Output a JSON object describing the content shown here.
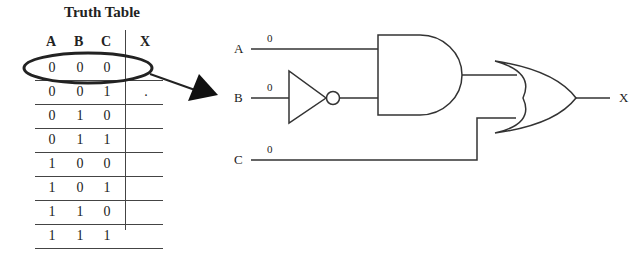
{
  "truth_table": {
    "title": "Truth Table",
    "headers": [
      "A",
      "B",
      "C",
      "X"
    ],
    "rows": [
      [
        "0",
        "0",
        "0",
        ""
      ],
      [
        "0",
        "0",
        "1",
        "."
      ],
      [
        "0",
        "1",
        "0",
        ""
      ],
      [
        "0",
        "1",
        "1",
        ""
      ],
      [
        "1",
        "0",
        "0",
        ""
      ],
      [
        "1",
        "0",
        "1",
        ""
      ],
      [
        "1",
        "1",
        "0",
        ""
      ],
      [
        "1",
        "1",
        "1",
        ""
      ]
    ],
    "highlighted_row": 0
  },
  "circuit": {
    "inputs": [
      {
        "name": "A",
        "value": "0"
      },
      {
        "name": "B",
        "value": "0"
      },
      {
        "name": "C",
        "value": "0"
      }
    ],
    "output": {
      "name": "X"
    },
    "gates": [
      "NOT",
      "AND",
      "OR"
    ]
  }
}
